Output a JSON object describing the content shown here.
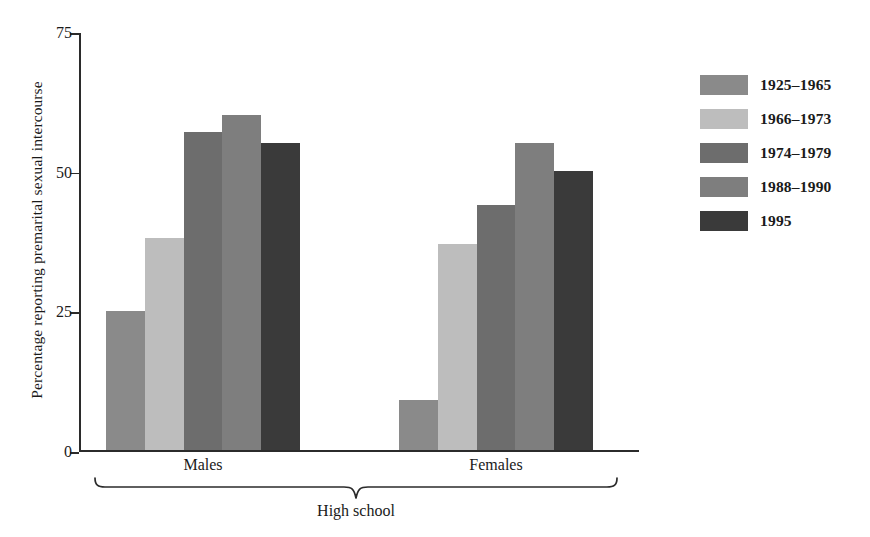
{
  "chart_data": {
    "type": "bar",
    "title": "",
    "xlabel": "High school",
    "ylabel": "Percentage reporting premarital sexual intercourse",
    "ylim": [
      0,
      75
    ],
    "yticks": [
      "0",
      "25",
      "50",
      "75"
    ],
    "ytick_values": [
      0,
      25,
      50,
      75
    ],
    "grid": false,
    "legend_position": "right",
    "categories": [
      "Males",
      "Females"
    ],
    "bracket_label": "High school",
    "series": [
      {
        "name": "1925–1965",
        "color": "#8a8a8a",
        "values": [
          25,
          9
        ]
      },
      {
        "name": "1966–1973",
        "color": "#bdbdbd",
        "values": [
          38,
          37
        ]
      },
      {
        "name": "1974–1979",
        "color": "#6d6d6d",
        "values": [
          57,
          44
        ]
      },
      {
        "name": "1988–1990",
        "color": "#7e7e7e",
        "values": [
          60,
          55
        ]
      },
      {
        "name": "1995",
        "color": "#3a3a3a",
        "values": [
          55,
          50
        ]
      }
    ]
  },
  "axis": {
    "y_title": "Percentage reporting premarital sexual intercourse",
    "tick_labels": [
      "75",
      "50",
      "25",
      "0"
    ]
  },
  "groups": [
    {
      "label": "Males"
    },
    {
      "label": "Females"
    }
  ],
  "bracket": {
    "label": "High school"
  },
  "legend": {
    "items": [
      {
        "label": "1925–1965",
        "color": "#8a8a8a"
      },
      {
        "label": "1966–1973",
        "color": "#bdbdbd"
      },
      {
        "label": "1974–1979",
        "color": "#6d6d6d"
      },
      {
        "label": "1988–1990",
        "color": "#7e7e7e"
      },
      {
        "label": "1995",
        "color": "#3a3a3a"
      }
    ]
  }
}
